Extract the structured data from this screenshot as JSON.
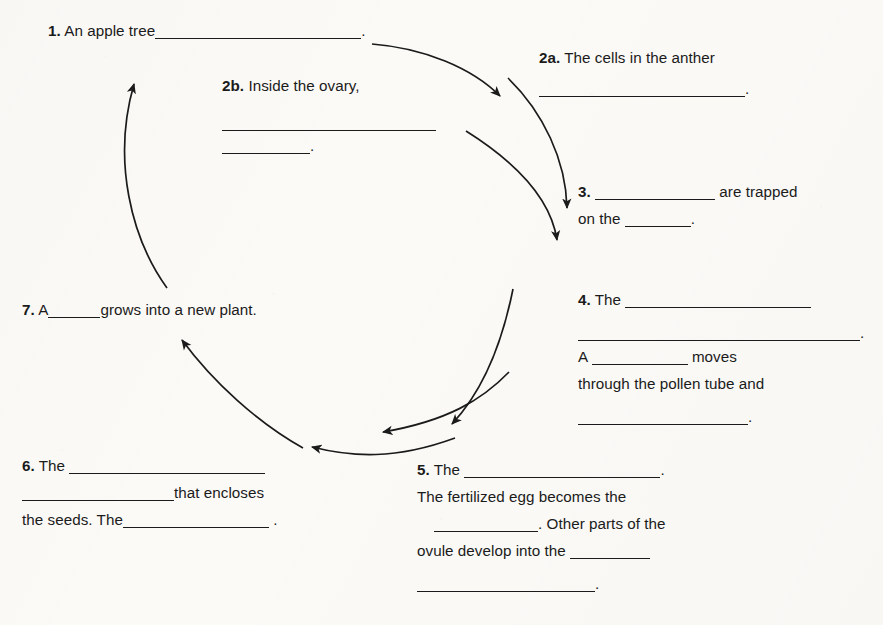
{
  "document": {
    "type": "fill-in-the-blank worksheet",
    "subject": "apple tree / flowering plant life cycle",
    "background_color": "#fbfaf7",
    "ink_color": "#1b1b1b"
  },
  "steps": {
    "s1": {
      "number": "1.",
      "text_before": "An apple tree",
      "blank_1": "",
      "period": "."
    },
    "s2a": {
      "number": "2a.",
      "line1": "The cells in the anther",
      "blank_1": "",
      "period": "."
    },
    "s2b": {
      "number": "2b.",
      "line1": "Inside the ovary,",
      "blank_1": "",
      "blank_2": "",
      "period": "."
    },
    "s3": {
      "number": "3.",
      "blank_1": "",
      "text_after_1": "are trapped",
      "text_before_2": "on the",
      "blank_2": "",
      "period": "."
    },
    "s4": {
      "number": "4.",
      "text_1": "The",
      "blank_1": "",
      "blank_2": "",
      "period_1": ".",
      "text_2": "A",
      "blank_3": "",
      "text_3": "moves",
      "line_3": "through the pollen tube and",
      "blank_4": "",
      "period_2": "."
    },
    "s5": {
      "number": "5.",
      "text_1": "The",
      "blank_1": "",
      "period_1": ".",
      "line_2": "The fertilized egg becomes the",
      "blank_2": "",
      "period_2": ".",
      "text_2": "Other parts of the",
      "line_3": "ovule develop into the",
      "blank_3": "",
      "blank_4": "",
      "period_3": "."
    },
    "s6": {
      "number": "6.",
      "text_1": "The",
      "blank_1": "",
      "blank_2": "",
      "text_2": "that encloses",
      "text_3": "the seeds. The",
      "blank_3": "",
      "period": "."
    },
    "s7": {
      "number": "7.",
      "text_1": "A",
      "blank_1": "",
      "text_2": "grows into a new plant."
    }
  },
  "arrows": [
    {
      "name": "arrow-1-to-2a",
      "from": "step 1",
      "to": "step 2a",
      "direction": "down-right"
    },
    {
      "name": "arrow-2a-to-3",
      "from": "step 2a",
      "to": "step 3",
      "direction": "down"
    },
    {
      "name": "arrow-2b-to-3",
      "from": "step 2b",
      "to": "step 3",
      "direction": "down-right"
    },
    {
      "name": "arrow-4-to-5",
      "from": "step 4",
      "to": "step 5",
      "direction": "down-left"
    },
    {
      "name": "arrow-4-to-6",
      "from": "step 4",
      "to": "step 6",
      "direction": "down-left"
    },
    {
      "name": "arrow-5-to-6",
      "from": "step 5",
      "to": "step 6",
      "direction": "left"
    },
    {
      "name": "arrow-6-to-7",
      "from": "step 6",
      "to": "step 7",
      "direction": "up-left"
    },
    {
      "name": "arrow-7-to-1",
      "from": "step 7",
      "to": "step 1",
      "direction": "up"
    }
  ]
}
